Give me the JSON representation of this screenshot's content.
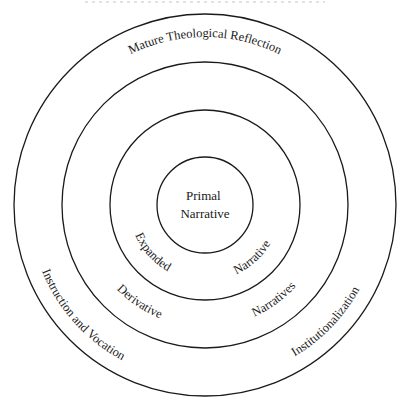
{
  "diagram": {
    "center": {
      "x": 205,
      "y": 205
    },
    "stroke_color": "#1a1a1a",
    "background": "#ffffff",
    "rings": [
      {
        "name": "core",
        "radius": 48
      },
      {
        "name": "inner",
        "radius": 95
      },
      {
        "name": "middle",
        "radius": 143
      },
      {
        "name": "outer",
        "radius": 191
      }
    ],
    "core": {
      "line1": "Primal",
      "line2": "Narrative"
    },
    "inner_band": {
      "left_label": "Expanded",
      "right_label": "Narrative"
    },
    "middle_band": {
      "left_label": "Derivative",
      "right_label": "Narratives"
    },
    "outer_band": {
      "top_label": "Mature Theological Reflection",
      "left_label": "Instruction and Vocation",
      "right_label": "Institutionalization"
    }
  }
}
